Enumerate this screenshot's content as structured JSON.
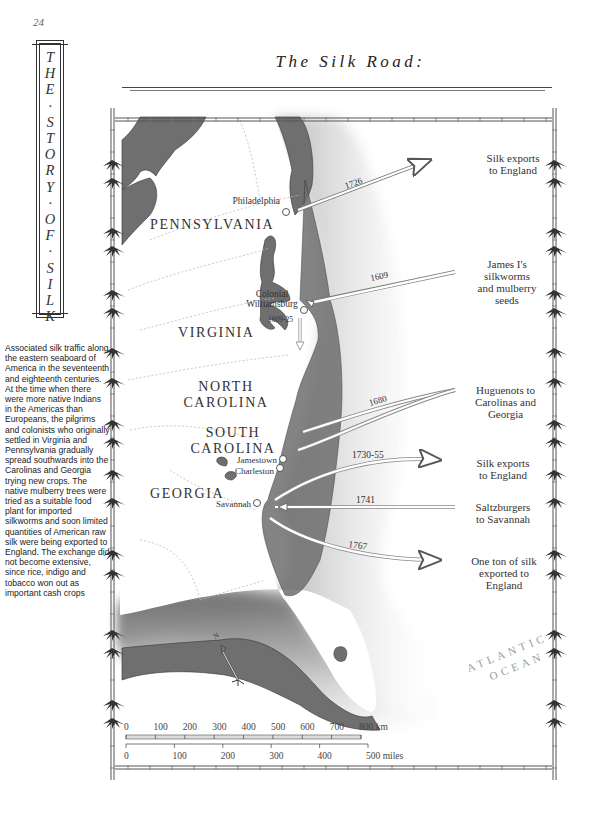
{
  "page": {
    "number": "24"
  },
  "spine": {
    "letters": [
      "T",
      "H",
      "E",
      "·",
      "S",
      "T",
      "O",
      "R",
      "Y",
      "·",
      "O",
      "F",
      "·",
      "S",
      "I",
      "L",
      "K"
    ]
  },
  "caption": {
    "text": "Associated silk traffic along the eastern seaboard of America in the seventeenth and eighteenth centuries. At the time when there were more native Indians in the Americas than Europeans, the pilgrims and colonists who originally settled in Virginia and Pennsylvania gradually spread southwards into the Carolinas and Georgia trying new crops. The native mulberry trees were tried as a suitable food plant for imported silkworms and soon limited quantities of American raw silk were being exported to England. The exchange did not become extensive, since rice, indigo and tobacco won out as important cash crops"
  },
  "title": "The Silk Road:",
  "map": {
    "states": {
      "pennsylvania": "PENNSYLVANIA",
      "virginia": "VIRGINIA",
      "north_carolina_1": "NORTH",
      "north_carolina_2": "CAROLINA",
      "south_carolina_1": "SOUTH",
      "south_carolina_2": "CAROLINA",
      "georgia": "GEORGIA"
    },
    "cities": {
      "philadelphia": "Philadelphia",
      "williamsburg_1": "Colonial",
      "williamsburg_2": "Williamsburg",
      "jamestown": "Jamestown",
      "charleston": "Charleston",
      "savannah": "Savannah"
    },
    "ocean": {
      "line1": "ATLANTIC",
      "line2": "OCEAN"
    },
    "routes": [
      {
        "year": "1726",
        "note_lines": [
          "Silk exports",
          "to England"
        ]
      },
      {
        "year": "1609",
        "note_lines": [
          "James I's",
          "silkworms",
          "and mulberry",
          "seeds"
        ]
      },
      {
        "year": "1609-25",
        "note_lines": []
      },
      {
        "year": "1680",
        "note_lines": [
          "Huguenots to",
          "Carolinas and",
          "Georgia"
        ]
      },
      {
        "year": "1730-55",
        "note_lines": [
          "Silk exports",
          "to England"
        ]
      },
      {
        "year": "1741",
        "note_lines": [
          "Saltzburgers",
          "to Savannah"
        ]
      },
      {
        "year": "1767",
        "note_lines": [
          "One ton of silk",
          "exported to",
          "England"
        ]
      }
    ],
    "compass": {
      "label": "N"
    },
    "scale_km": {
      "ticks": [
        "0",
        "100",
        "200",
        "300",
        "400",
        "500",
        "600",
        "700",
        "800 km"
      ]
    },
    "scale_miles": {
      "ticks": [
        "0",
        "100",
        "200",
        "300",
        "400",
        "500 miles"
      ]
    }
  }
}
